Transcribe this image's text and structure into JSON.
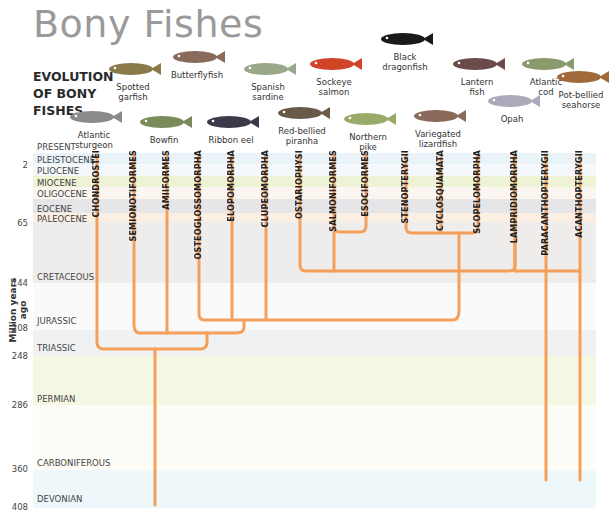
{
  "title": "Bony Fishes",
  "subtitle": [
    "EVOLUTION",
    "OF BONY",
    "FISHES"
  ],
  "fishes_top": [
    {
      "name": "Spotted garfish",
      "l1": "Spotted",
      "l2": "garfish",
      "x": 133,
      "y": 60,
      "color": "#8a7a4a"
    },
    {
      "name": "Butterflyfish",
      "l1": "",
      "l2": "Butterflyfish",
      "x": 197,
      "y": 48,
      "color": "#8a6a5a"
    },
    {
      "name": "Spanish sardine",
      "l1": "Spanish",
      "l2": "sardine",
      "x": 268,
      "y": 60,
      "color": "#9aa88a"
    },
    {
      "name": "Sockeye salmon",
      "l1": "Sockeye",
      "l2": "salmon",
      "x": 334,
      "y": 55,
      "color": "#d0452a"
    },
    {
      "name": "Black dragonfish",
      "l1": "Black",
      "l2": "dragonfish",
      "x": 405,
      "y": 30,
      "color": "#1a1a1a"
    },
    {
      "name": "Lantern fish",
      "l1": "Lantern",
      "l2": "fish",
      "x": 477,
      "y": 55,
      "color": "#6a4a4a"
    },
    {
      "name": "Atlantic cod",
      "l1": "Atlantic",
      "l2": "cod",
      "x": 546,
      "y": 55,
      "color": "#8a9a6a"
    }
  ],
  "fishes_bottom": [
    {
      "name": "Atlantic sturgeon",
      "l1": "Atlantic",
      "l2": "sturgeon",
      "x": 94,
      "y": 108,
      "color": "#8a8a8a"
    },
    {
      "name": "Bowfin",
      "l1": "",
      "l2": "Bowfin",
      "x": 164,
      "y": 113,
      "color": "#7a8a5a"
    },
    {
      "name": "Ribbon eel",
      "l1": "",
      "l2": "Ribbon eel",
      "x": 231,
      "y": 113,
      "color": "#3a3a4a"
    },
    {
      "name": "Red-bellied piranha",
      "l1": "",
      "l2": "Red-bellied piranha",
      "x": 302,
      "y": 104,
      "color": "#6a5a4a"
    },
    {
      "name": "Northern pike",
      "l1": "Northern",
      "l2": "pike",
      "x": 368,
      "y": 110,
      "color": "#9aaa6a"
    },
    {
      "name": "Variegated lizardfish",
      "l1": "Variegated",
      "l2": "lizardfish",
      "x": 438,
      "y": 107,
      "color": "#8a6a5a"
    },
    {
      "name": "Opah",
      "l1": "",
      "l2": "Opah",
      "x": 512,
      "y": 92,
      "color": "#aaaabb"
    },
    {
      "name": "Pot-bellied seahorse",
      "l1": "Pot-bellied",
      "l2": "seahorse",
      "x": 581,
      "y": 68,
      "color": "#a06a3a"
    }
  ],
  "timeline": {
    "axis_label": "Million years ago",
    "present_label": "PRESENT",
    "ticks": [
      {
        "label": "2",
        "y": 165
      },
      {
        "label": "65",
        "y": 223
      },
      {
        "label": "144",
        "y": 283
      },
      {
        "label": "208",
        "y": 328
      },
      {
        "label": "248",
        "y": 356
      },
      {
        "label": "286",
        "y": 405
      },
      {
        "label": "360",
        "y": 469
      },
      {
        "label": "408",
        "y": 507
      }
    ],
    "bands": [
      {
        "name": "PLEISTOCENE",
        "top": 153,
        "h": 11,
        "color": "#eaf3f8",
        "label_y": 155
      },
      {
        "name": "PLIOCENE",
        "top": 164,
        "h": 12,
        "color": "#f4f8fb",
        "label_y": 166
      },
      {
        "name": "MIOCENE",
        "top": 176,
        "h": 11,
        "color": "#eef3d6",
        "label_y": 178
      },
      {
        "name": "OLIGOCENE",
        "top": 187,
        "h": 12,
        "color": "#fbf6ef",
        "label_y": 189
      },
      {
        "name": "EOCENE",
        "top": 199,
        "h": 14,
        "color": "#e6e6e8",
        "label_y": 204
      },
      {
        "name": "PALEOCENE",
        "top": 213,
        "h": 9,
        "color": "#fbeee2",
        "label_y": 214
      },
      {
        "name": "CRETACEOUS",
        "top": 222,
        "h": 61,
        "color": "#efedec",
        "label_y": 272
      },
      {
        "name": "JURASSIC",
        "top": 283,
        "h": 47,
        "color": "#fafafa",
        "label_y": 316
      },
      {
        "name": "TRIASSIC",
        "top": 330,
        "h": 26,
        "color": "#eff1f3",
        "label_y": 343
      },
      {
        "name": "PERMIAN",
        "top": 356,
        "h": 49,
        "color": "#f6f6e4",
        "label_y": 394
      },
      {
        "name": "CARBONIFEROUS",
        "top": 405,
        "h": 65,
        "color": "#fdfcf7",
        "label_y": 458
      },
      {
        "name": "DEVONIAN",
        "top": 470,
        "h": 38,
        "color": "#eef8fb",
        "label_y": 494
      }
    ]
  },
  "clades": [
    {
      "name": "CHONDROSTEI",
      "x": 97
    },
    {
      "name": "SEMIONOTIFORMES",
      "x": 134
    },
    {
      "name": "AMIIFORMES",
      "x": 167
    },
    {
      "name": "OSTEOGLOSSOMORPHA",
      "x": 199
    },
    {
      "name": "ELOPOMORPHA",
      "x": 232
    },
    {
      "name": "CLUPEOMORPHA",
      "x": 266
    },
    {
      "name": "OSTARIOPHYSI",
      "x": 300
    },
    {
      "name": "SALMONIFORMES",
      "x": 334
    },
    {
      "name": "ESOCIFORMES",
      "x": 366
    },
    {
      "name": "STENOPTERYGII",
      "x": 406
    },
    {
      "name": "CYCLOSQUAMATA",
      "x": 441
    },
    {
      "name": "SCOPELOMORPHA",
      "x": 478
    },
    {
      "name": "LAMPRIDIOMORPHA",
      "x": 515
    },
    {
      "name": "PARACANTHOPTERYGII",
      "x": 546
    },
    {
      "name": "ACANTHOPTERYGII",
      "x": 580
    }
  ],
  "tree_color": "#f5a05a"
}
